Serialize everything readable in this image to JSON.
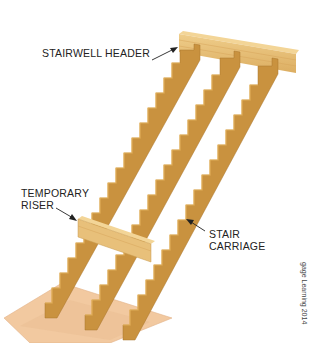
{
  "figure": {
    "type": "stair framing diagram",
    "labels": {
      "stairwell_header": "STAIRWELL HEADER",
      "temporary_riser_line1": "TEMPORARY",
      "temporary_riser_line2": "RISER",
      "stair_carriage_line1": "STAIR",
      "stair_carriage_line2": "CARRIAGE"
    },
    "credit": "gage Learning 2014",
    "colors": {
      "wood_face": "#c9923f",
      "wood_edge": "#e6b35c",
      "wood_dark": "#a8752c",
      "header_face": "#e8c07a",
      "plywood": "#f2c9a0",
      "arrow": "#222222",
      "text": "#222222"
    },
    "components": [
      "stairwell header",
      "stair carriage (3)",
      "temporary riser",
      "plywood base"
    ]
  }
}
